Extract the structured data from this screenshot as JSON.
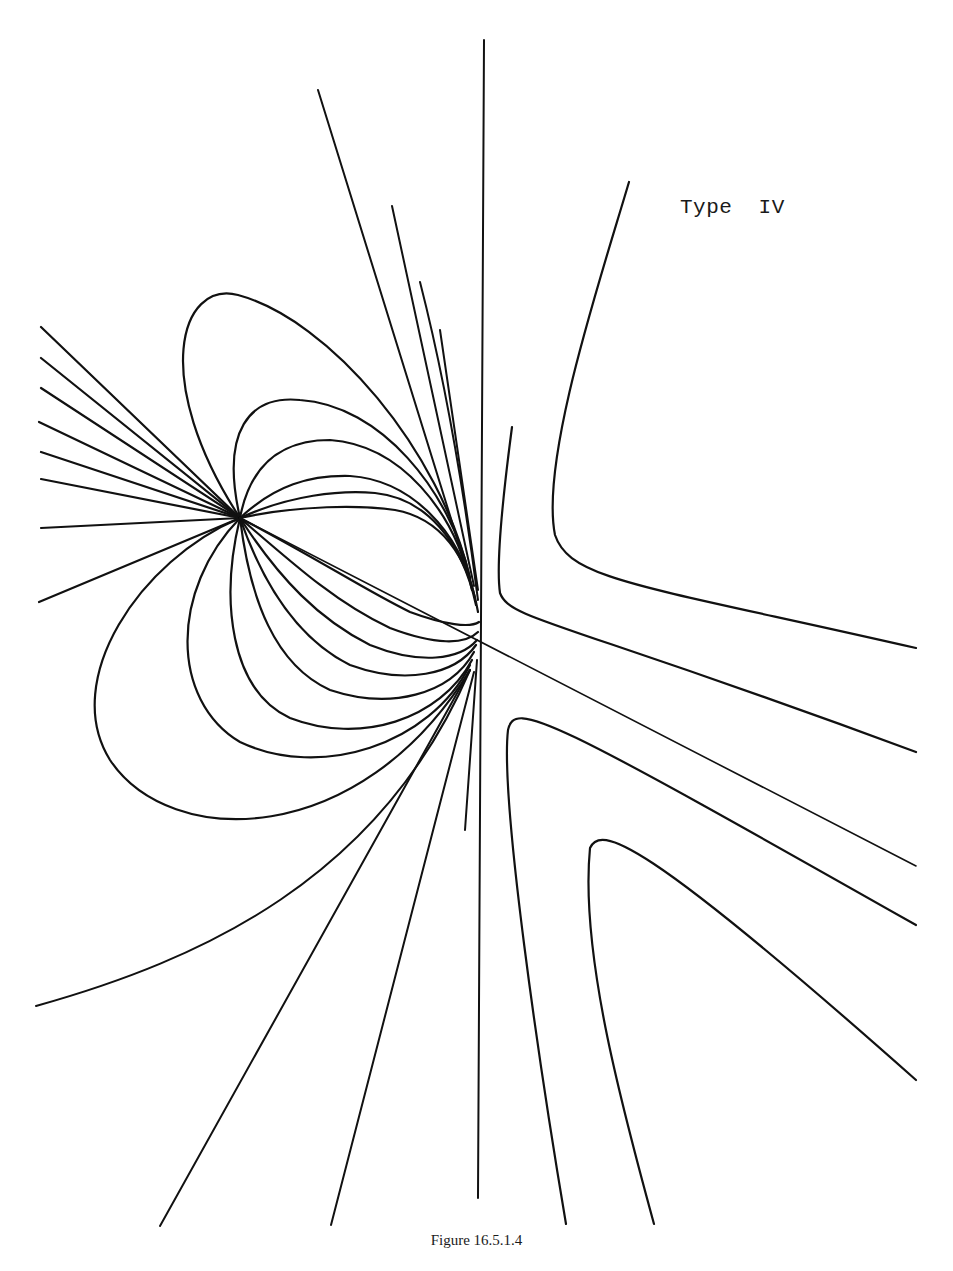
{
  "figure": {
    "label": "Type  IV",
    "caption": "Figure 16.5.1.4",
    "stroke_color": "#111111",
    "background": "#ffffff",
    "groups": [
      {
        "name": "vertical-axis-line",
        "width": 2,
        "paths": [
          "M 484 40 L 478 1198"
        ]
      },
      {
        "name": "diagonal-separatrix",
        "width": 1.6,
        "paths": [
          "M 240 518 L 916 866"
        ]
      },
      {
        "name": "left-fan-lines",
        "width": 2.2,
        "paths": [
          "M 41 327 L 240 518",
          "M 41 358 L 240 518",
          "M 41 388 L 240 518",
          "M 39 422 L 240 518",
          "M 41 452 L 240 518",
          "M 41 479 L 240 518",
          "M 41 528 L 240 518",
          "M 39 602 L 240 518"
        ]
      },
      {
        "name": "upper-loops",
        "width": 2.2,
        "paths": [
          "M 240 518 C 150 380, 180 280, 238 295 C 330 320, 440 450, 470 578",
          "M 240 518 C 220 430, 250 395, 300 400 C 380 405, 450 490, 470 578",
          "M 240 518 C 250 465, 280 440, 330 440 C 400 445, 455 510, 472 590",
          "M 240 518 C 275 485, 310 475, 350 476 C 410 480, 460 530, 475 598",
          "M 240 518 C 290 495, 340 490, 375 493 C 425 498, 462 540, 476 605",
          "M 240 518 C 300 505, 360 505, 395 510 C 440 518, 468 555, 478 612"
        ]
      },
      {
        "name": "lower-loops",
        "width": 2.2,
        "paths": [
          "M 240 518 C 140 560, 60 680, 110 760 C 170 850, 360 850, 470 670",
          "M 240 518 C 170 590, 170 700, 240 742 C 320 780, 430 745, 470 665",
          "M 240 518 C 220 600, 230 690, 290 718 C 360 745, 440 720, 472 660",
          "M 240 518 C 250 600, 275 665, 330 690 C 390 710, 450 695, 474 652",
          "M 240 518 C 265 590, 300 640, 350 665 C 405 685, 455 675, 476 645",
          "M 240 518 C 280 580, 320 620, 370 645 C 420 665, 460 660, 477 640",
          "M 240 518 C 300 570, 340 605, 390 628 C 435 645, 465 645, 478 632",
          "M 240 518 C 320 560, 365 590, 410 612 C 445 625, 470 628, 479 622"
        ]
      },
      {
        "name": "upper-rays-to-node",
        "width": 2,
        "paths": [
          "M 318 90 L 470 580",
          "M 392 206 L 474 586",
          "M 420 282 C 440 360, 460 460, 478 600",
          "M 440 330 L 478 590"
        ]
      },
      {
        "name": "lower-rays",
        "width": 2,
        "paths": [
          "M 36 1006 C 200 960, 380 880, 470 670",
          "M 160 1226 L 470 670",
          "M 331 1225 L 474 672",
          "M 465 830 L 477 660"
        ]
      },
      {
        "name": "right-hyperbolas",
        "width": 2.2,
        "paths": [
          "M 629 182 C 600 280, 540 460, 555 535 C 570 580, 640 585, 916 648",
          "M 512 427 C 505 480, 495 560, 500 593 C 510 620, 560 620, 916 752",
          "M 566 1224 C 540 1070, 500 800, 508 730 C 515 700, 545 715, 916 925",
          "M 654 1224 C 620 1100, 580 950, 590 848 C 600 825, 640 835, 916 1080"
        ]
      }
    ]
  }
}
